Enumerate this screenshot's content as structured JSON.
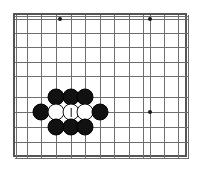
{
  "figure": {
    "kind": "go-board-diagram",
    "width": 199,
    "height": 170
  },
  "board": {
    "background_color": "#ffffff",
    "frame_color": "#555555",
    "line_color": "#6f6f6f",
    "major_line_color": "#4a4a4a",
    "frame": {
      "left": 13,
      "top": 13,
      "width": 174,
      "height": 144
    },
    "columns": 13,
    "rows": 10,
    "cell_width": 14.5,
    "cell_height": 14.5,
    "origin_x": 14,
    "origin_y": 14,
    "vertical_lines_x": [
      14,
      24.5,
      39,
      54,
      68.5,
      83,
      97.5,
      112,
      126.5,
      141,
      148,
      162,
      176,
      186
    ],
    "horizontal_lines_y": [
      14,
      17,
      31,
      45,
      60,
      74,
      95,
      110,
      125,
      140,
      156
    ]
  },
  "star_points": [
    {
      "label": "hoshi-top-left",
      "x": 58,
      "y": 17
    },
    {
      "label": "hoshi-top-right",
      "x": 148,
      "y": 17
    },
    {
      "label": "hoshi-middle-right",
      "x": 148,
      "y": 110
    }
  ],
  "stones": [
    {
      "id": "b1",
      "color": "black",
      "x": 54,
      "y": 95,
      "marked": false
    },
    {
      "id": "b2",
      "color": "black",
      "x": 69,
      "y": 95,
      "marked": false
    },
    {
      "id": "b3",
      "color": "black",
      "x": 83,
      "y": 95,
      "marked": false
    },
    {
      "id": "b4",
      "color": "black",
      "x": 39,
      "y": 110,
      "marked": false
    },
    {
      "id": "w1",
      "color": "white",
      "x": 54,
      "y": 110,
      "marked": false
    },
    {
      "id": "w2",
      "color": "white",
      "x": 69,
      "y": 110,
      "marked": true
    },
    {
      "id": "w3",
      "color": "white",
      "x": 83,
      "y": 110,
      "marked": false
    },
    {
      "id": "b5",
      "color": "black",
      "x": 98,
      "y": 110,
      "marked": false
    },
    {
      "id": "b6",
      "color": "black",
      "x": 54,
      "y": 125,
      "marked": false
    },
    {
      "id": "b7",
      "color": "black",
      "x": 69,
      "y": 125,
      "marked": false
    },
    {
      "id": "b8",
      "color": "black",
      "x": 83,
      "y": 125,
      "marked": false
    }
  ],
  "colors": {
    "black_stone": "#111111",
    "white_stone": "#ffffff",
    "white_stone_outline": "#111111",
    "mark": "#111111"
  }
}
